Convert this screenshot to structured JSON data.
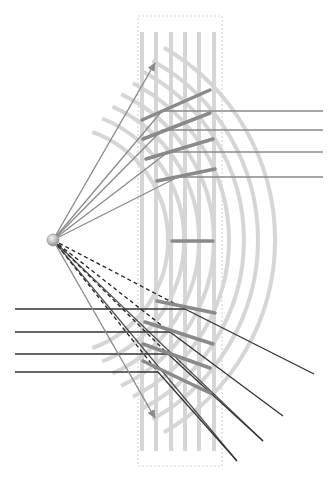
{
  "diagram": {
    "type": "beam-steering-metasurface",
    "source": {
      "x": 53,
      "y": 240,
      "r": 6
    },
    "frame": {
      "x": 138,
      "y": 16,
      "w": 84,
      "h": 450,
      "stroke": "#d8d8d8"
    },
    "bars": {
      "xs": [
        142,
        156,
        171,
        185,
        199,
        214
      ],
      "y1": 32,
      "y2": 451,
      "color": "#d6d6d6",
      "width": 4
    },
    "arcs": {
      "color": "#d4d4d4",
      "width": 4,
      "items": [
        {
          "r": 115,
          "a1": -70,
          "a2": 70
        },
        {
          "r": 131,
          "a1": -68,
          "a2": 68
        },
        {
          "r": 146,
          "a1": -66,
          "a2": 66
        },
        {
          "r": 161,
          "a1": -65,
          "a2": 65
        },
        {
          "r": 176,
          "a1": -63,
          "a2": 63
        },
        {
          "r": 191,
          "a1": -62,
          "a2": 62
        },
        {
          "r": 205,
          "a1": -61,
          "a2": 61
        },
        {
          "r": 222,
          "a1": -60,
          "a2": 60
        }
      ]
    },
    "mirrors": {
      "color": "#8a8a8a",
      "width": 3.5,
      "items": [
        [
          142,
          120,
          210,
          90
        ],
        [
          143,
          139,
          210,
          113
        ],
        [
          146,
          159,
          213,
          139
        ],
        [
          157,
          181,
          215,
          169
        ],
        [
          172,
          241,
          213,
          241
        ],
        [
          157,
          301,
          215,
          313
        ],
        [
          145,
          322,
          213,
          344
        ],
        [
          143,
          344,
          210,
          368
        ],
        [
          143,
          361,
          210,
          393
        ]
      ]
    },
    "arrows": {
      "color": "#8c8c8c",
      "items": [
        {
          "to": [
            155,
            63
          ]
        },
        {
          "to": [
            155,
            418
          ]
        }
      ]
    },
    "upper_rays": {
      "color": "#8a8a8a",
      "incoming": [
        [
          162,
          111
        ],
        [
          162,
          130
        ],
        [
          168,
          152
        ],
        [
          178,
          177
        ]
      ],
      "outgoing_end_x": 323
    },
    "lower_rays": {
      "color": "#333333",
      "incoming_start_x": 15,
      "incoming": [
        {
          "y": 309,
          "hit": [
            185,
            309
          ],
          "out": [
            314,
            374
          ]
        },
        {
          "y": 332,
          "hit": [
            170,
            332
          ],
          "out": [
            283,
            416
          ]
        },
        {
          "y": 354,
          "hit": [
            168,
            354
          ],
          "out": [
            263,
            441
          ]
        },
        {
          "y": 372,
          "hit": [
            158,
            372
          ],
          "out": [
            237,
            461
          ]
        }
      ],
      "dashed_color": "#222222"
    }
  }
}
